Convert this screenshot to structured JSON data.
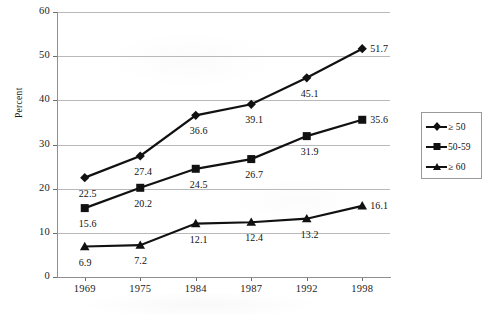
{
  "chart_data": {
    "type": "line",
    "title": "",
    "xlabel": "",
    "ylabel": "Percent",
    "categories": [
      "1969",
      "1975",
      "1984",
      "1987",
      "1992",
      "1998"
    ],
    "ylim": [
      0,
      60
    ],
    "yticks": [
      0,
      10,
      20,
      30,
      40,
      50,
      60
    ],
    "grid": "horizontal",
    "legend_position": "right",
    "series": [
      {
        "name": "≥ 50",
        "marker": "diamond",
        "color": "#111111",
        "values": [
          22.5,
          27.4,
          36.6,
          39.1,
          45.1,
          51.7
        ],
        "labels": [
          "22.5",
          "27.4",
          "36.6",
          "39.1",
          "45.1",
          "51.7"
        ]
      },
      {
        "name": "50-59",
        "marker": "square",
        "color": "#111111",
        "values": [
          15.6,
          20.2,
          24.5,
          26.7,
          31.9,
          35.6
        ],
        "labels": [
          "15.6",
          "20.2",
          "24.5",
          "26.7",
          "31.9",
          "35.6"
        ]
      },
      {
        "name": "≥ 60",
        "marker": "triangle",
        "color": "#111111",
        "values": [
          6.9,
          7.2,
          12.1,
          12.4,
          13.2,
          16.1
        ],
        "labels": [
          "6.9",
          "7.2",
          "12.1",
          "12.4",
          "13.2",
          "16.1"
        ]
      }
    ]
  },
  "axis": {
    "y_title": "Percent",
    "y_tick_labels": [
      "60",
      "50",
      "40",
      "30",
      "20",
      "10",
      "0"
    ],
    "x_tick_labels": [
      "1969",
      "1975",
      "1984",
      "1987",
      "1992",
      "1998"
    ]
  },
  "legend": {
    "entries": [
      {
        "label": "≥ 50",
        "marker": "diamond"
      },
      {
        "label": "50-59",
        "marker": "square"
      },
      {
        "label": "≥ 60",
        "marker": "triangle"
      }
    ]
  }
}
